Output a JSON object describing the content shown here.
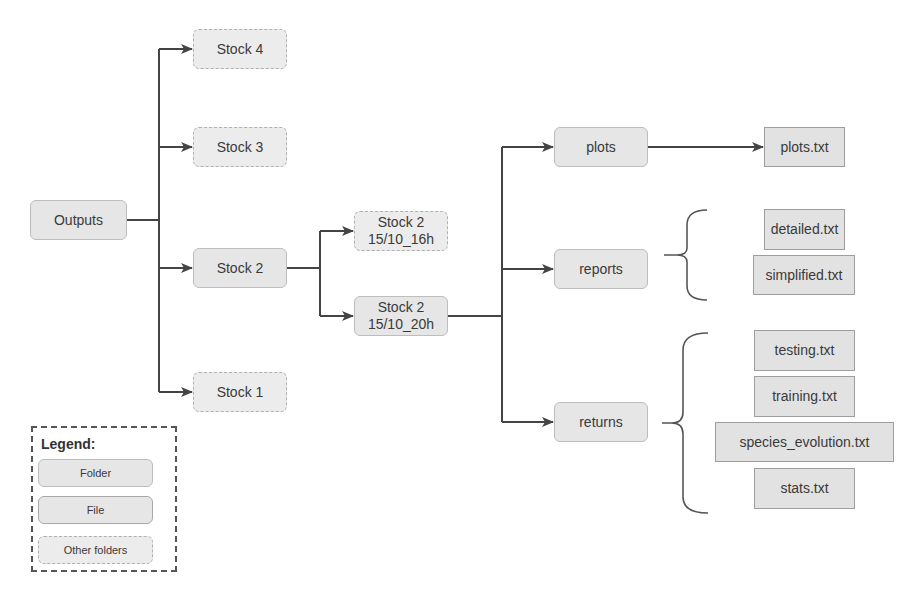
{
  "diagram": {
    "root": {
      "label": "Outputs",
      "type": "folder"
    },
    "stocks": [
      {
        "label": "Stock 4",
        "type": "other"
      },
      {
        "label": "Stock 3",
        "type": "other"
      },
      {
        "label": "Stock 2",
        "type": "folder"
      },
      {
        "label": "Stock 1",
        "type": "other"
      }
    ],
    "runs": [
      {
        "label": "Stock 2\n15/10_16h",
        "line1": "Stock 2",
        "line2": "15/10_16h",
        "type": "other"
      },
      {
        "label": "Stock 2\n15/10_20h",
        "line1": "Stock 2",
        "line2": "15/10_20h",
        "type": "folder"
      }
    ],
    "subfolders": [
      {
        "label": "plots",
        "type": "folder",
        "files": [
          "plots.txt"
        ]
      },
      {
        "label": "reports",
        "type": "folder",
        "files": [
          "detailed.txt",
          "simplified.txt"
        ]
      },
      {
        "label": "returns",
        "type": "folder",
        "files": [
          "testing.txt",
          "training.txt",
          "species_evolution.txt",
          "stats.txt"
        ]
      }
    ]
  },
  "legend": {
    "title": "Legend:",
    "items": [
      {
        "label": "Folder",
        "type": "folder"
      },
      {
        "label": "File",
        "type": "file"
      },
      {
        "label": "Other folders",
        "type": "other"
      }
    ]
  },
  "colors": {
    "box_fill": "#e6e6e6",
    "box_border": "#bdbdbd",
    "line": "#444444"
  }
}
